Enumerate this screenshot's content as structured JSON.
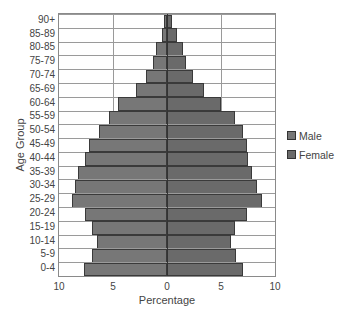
{
  "chart_data": {
    "type": "bar",
    "orientation": "horizontal",
    "subtype": "population-pyramid",
    "title": "",
    "xlabel": "Percentage",
    "ylabel": "Age Group",
    "xlim": [
      -10,
      10
    ],
    "x_ticks": [
      "10",
      "5",
      "0",
      "5",
      "10"
    ],
    "grid": true,
    "legend_position": "right",
    "categories": [
      "90+",
      "85-89",
      "80-85",
      "75-79",
      "70-74",
      "65-69",
      "60-64",
      "55-59",
      "50-54",
      "45-49",
      "40-44",
      "35-39",
      "30-34",
      "25-29",
      "20-24",
      "15-19",
      "10-14",
      "5-9",
      "0-4"
    ],
    "series": [
      {
        "name": "Male",
        "color": "#777777",
        "side": "left",
        "values": [
          0.3,
          0.5,
          1.0,
          1.3,
          1.9,
          2.9,
          4.5,
          5.4,
          6.3,
          7.2,
          7.6,
          8.2,
          8.5,
          8.8,
          7.6,
          6.9,
          6.5,
          6.9,
          7.7
        ]
      },
      {
        "name": "Female",
        "color": "#6a6a6a",
        "side": "right",
        "values": [
          0.5,
          0.9,
          1.5,
          1.8,
          2.4,
          3.4,
          5.0,
          6.3,
          7.0,
          7.4,
          7.5,
          7.9,
          8.3,
          8.8,
          7.4,
          6.3,
          5.9,
          6.4,
          7.0
        ]
      }
    ]
  },
  "legend": {
    "items": [
      {
        "label": "Male",
        "color": "#777777"
      },
      {
        "label": "Female",
        "color": "#6a6a6a"
      }
    ]
  },
  "axes": {
    "xlabel": "Percentage",
    "ylabel": "Age Group"
  }
}
